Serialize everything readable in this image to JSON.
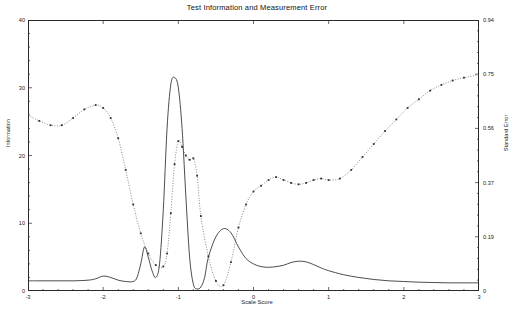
{
  "chart": {
    "title": "Test Information and Measurement Error",
    "xlabel": "Scale Score",
    "ylabel_left": "Information",
    "ylabel_right": "Standard Error"
  },
  "axes": {
    "x_ticks": [
      "-3",
      "-2",
      "-1",
      "0",
      "1",
      "2",
      "3"
    ],
    "y_left_ticks": [
      "0",
      "10",
      "20",
      "30",
      "40"
    ],
    "y_right_ticks": [
      "0",
      "0.19",
      "0.37",
      "0.56",
      "0.75",
      "0.94"
    ]
  },
  "chart_data": {
    "type": "line",
    "title": "Test Information and Measurement Error",
    "xlabel": "Scale Score",
    "ylabel": "Information",
    "ylabel_secondary": "Standard Error",
    "xlim": [
      -3,
      3
    ],
    "ylim": [
      0,
      40
    ],
    "ylim_secondary": [
      0,
      0.94
    ],
    "grid": false,
    "legend": "none",
    "series": [
      {
        "name": "Information",
        "axis": "left",
        "style": "solid",
        "markers": false,
        "x": [
          -3.0,
          -2.8,
          -2.6,
          -2.4,
          -2.2,
          -2.1,
          -2.0,
          -1.9,
          -1.8,
          -1.7,
          -1.6,
          -1.55,
          -1.5,
          -1.45,
          -1.4,
          -1.35,
          -1.3,
          -1.25,
          -1.2,
          -1.15,
          -1.1,
          -1.05,
          -1.0,
          -0.95,
          -0.9,
          -0.85,
          -0.8,
          -0.75,
          -0.7,
          -0.65,
          -0.6,
          -0.5,
          -0.4,
          -0.3,
          -0.2,
          -0.1,
          0.0,
          0.1,
          0.2,
          0.3,
          0.4,
          0.5,
          0.6,
          0.7,
          0.8,
          0.9,
          1.0,
          1.2,
          1.4,
          1.6,
          1.8,
          2.0,
          2.2,
          2.4,
          2.6,
          2.8,
          3.0
        ],
        "y": [
          1.5,
          1.5,
          1.5,
          1.5,
          1.6,
          1.8,
          2.2,
          2.0,
          1.6,
          1.4,
          1.4,
          2.0,
          4.0,
          6.5,
          5.0,
          3.0,
          2.0,
          4.0,
          12.0,
          24.0,
          30.5,
          31.5,
          30.0,
          24.0,
          14.0,
          5.0,
          1.0,
          0.3,
          0.6,
          2.0,
          5.0,
          8.0,
          9.2,
          8.6,
          6.5,
          4.8,
          4.0,
          3.6,
          3.5,
          3.6,
          3.8,
          4.2,
          4.4,
          4.3,
          3.9,
          3.4,
          3.0,
          2.4,
          2.0,
          1.7,
          1.5,
          1.4,
          1.3,
          1.25,
          1.2,
          1.2,
          1.2
        ]
      },
      {
        "name": "Standard Error",
        "axis": "right",
        "style": "dotted",
        "markers": true,
        "x": [
          -3.0,
          -2.85,
          -2.7,
          -2.55,
          -2.4,
          -2.25,
          -2.1,
          -2.0,
          -1.9,
          -1.8,
          -1.7,
          -1.6,
          -1.5,
          -1.4,
          -1.3,
          -1.2,
          -1.15,
          -1.1,
          -1.05,
          -1.0,
          -0.95,
          -0.9,
          -0.85,
          -0.8,
          -0.75,
          -0.7,
          -0.6,
          -0.5,
          -0.4,
          -0.3,
          -0.2,
          -0.1,
          0.0,
          0.1,
          0.2,
          0.3,
          0.4,
          0.5,
          0.6,
          0.7,
          0.8,
          0.9,
          1.0,
          1.15,
          1.3,
          1.45,
          1.6,
          1.75,
          1.9,
          2.05,
          2.2,
          2.35,
          2.5,
          2.65,
          2.8,
          3.0
        ],
        "y": [
          0.61,
          0.59,
          0.575,
          0.575,
          0.6,
          0.63,
          0.645,
          0.635,
          0.6,
          0.53,
          0.42,
          0.3,
          0.2,
          0.13,
          0.09,
          0.085,
          0.13,
          0.27,
          0.44,
          0.52,
          0.5,
          0.47,
          0.455,
          0.46,
          0.4,
          0.26,
          0.12,
          0.035,
          0.02,
          0.1,
          0.22,
          0.3,
          0.345,
          0.365,
          0.385,
          0.395,
          0.385,
          0.375,
          0.37,
          0.375,
          0.385,
          0.39,
          0.385,
          0.39,
          0.42,
          0.465,
          0.51,
          0.555,
          0.595,
          0.635,
          0.665,
          0.695,
          0.715,
          0.73,
          0.74,
          0.75
        ]
      }
    ]
  }
}
